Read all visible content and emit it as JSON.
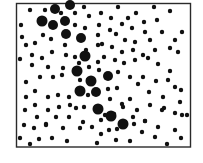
{
  "figure": {
    "background": "#ffffff",
    "frame": {
      "x": 16.5,
      "y": 3.5,
      "width": 174,
      "height": 143.5,
      "color": "#2a2a2a"
    },
    "dot_color": "#111111",
    "small_dots": [
      [
        30,
        10
      ],
      [
        45,
        10
      ],
      [
        70,
        7
      ],
      [
        84,
        7
      ],
      [
        118,
        7
      ],
      [
        154,
        7
      ],
      [
        170,
        11
      ],
      [
        21,
        25
      ],
      [
        61,
        13
      ],
      [
        75,
        13
      ],
      [
        89,
        16
      ],
      [
        101,
        13
      ],
      [
        111,
        18
      ],
      [
        128,
        18
      ],
      [
        136,
        13
      ],
      [
        144,
        22
      ],
      [
        157,
        20
      ],
      [
        22,
        37
      ],
      [
        43,
        35
      ],
      [
        51,
        39
      ],
      [
        75,
        25
      ],
      [
        85,
        28
      ],
      [
        99,
        25
      ],
      [
        110,
        30
      ],
      [
        122,
        24
      ],
      [
        132,
        28
      ],
      [
        145,
        32
      ],
      [
        162,
        32
      ],
      [
        182,
        32
      ],
      [
        26,
        45
      ],
      [
        35,
        43
      ],
      [
        65,
        45
      ],
      [
        98,
        35
      ],
      [
        102,
        44
      ],
      [
        116,
        34
      ],
      [
        125,
        40
      ],
      [
        135,
        42
      ],
      [
        150,
        40
      ],
      [
        175,
        40
      ],
      [
        20,
        59
      ],
      [
        32,
        55
      ],
      [
        42,
        58
      ],
      [
        52,
        52
      ],
      [
        66,
        55
      ],
      [
        75,
        57
      ],
      [
        86,
        50
      ],
      [
        98,
        45
      ],
      [
        112,
        47
      ],
      [
        122,
        52
      ],
      [
        133,
        50
      ],
      [
        143,
        55
      ],
      [
        155,
        50
      ],
      [
        170,
        48
      ],
      [
        178,
        52
      ],
      [
        32,
        65
      ],
      [
        48,
        67
      ],
      [
        63,
        68
      ],
      [
        79,
        63
      ],
      [
        89,
        67
      ],
      [
        98,
        62
      ],
      [
        104,
        57
      ],
      [
        115,
        60
      ],
      [
        124,
        63
      ],
      [
        135,
        60
      ],
      [
        148,
        58
      ],
      [
        158,
        64
      ],
      [
        170,
        71
      ],
      [
        26,
        82
      ],
      [
        40,
        77
      ],
      [
        53,
        77
      ],
      [
        62,
        75
      ],
      [
        80,
        80
      ],
      [
        88,
        80
      ],
      [
        99,
        70
      ],
      [
        108,
        75
      ],
      [
        118,
        72
      ],
      [
        130,
        77
      ],
      [
        143,
        77
      ],
      [
        156,
        81
      ],
      [
        168,
        80
      ],
      [
        26,
        97
      ],
      [
        35,
        91
      ],
      [
        48,
        97
      ],
      [
        58,
        95
      ],
      [
        69,
        97
      ],
      [
        88,
        95
      ],
      [
        108,
        89
      ],
      [
        117,
        88
      ],
      [
        130,
        99
      ],
      [
        138,
        84
      ],
      [
        149,
        92
      ],
      [
        163,
        97
      ],
      [
        175,
        87
      ],
      [
        181,
        90
      ],
      [
        25,
        110
      ],
      [
        35,
        105
      ],
      [
        48,
        110
      ],
      [
        59,
        107
      ],
      [
        70,
        105
      ],
      [
        76,
        108
      ],
      [
        84,
        107
      ],
      [
        105,
        115
      ],
      [
        110,
        99
      ],
      [
        122,
        104
      ],
      [
        137,
        110
      ],
      [
        150,
        105
      ],
      [
        164,
        108
      ],
      [
        180,
        102
      ],
      [
        24,
        125
      ],
      [
        37,
        117
      ],
      [
        46,
        124
      ],
      [
        56,
        117
      ],
      [
        69,
        117
      ],
      [
        83,
        122
      ],
      [
        101,
        120
      ],
      [
        114,
        114
      ],
      [
        123,
        107
      ],
      [
        133,
        117
      ],
      [
        145,
        121
      ],
      [
        162,
        110
      ],
      [
        175,
        113
      ],
      [
        187,
        115
      ],
      [
        20,
        138
      ],
      [
        34,
        128
      ],
      [
        46,
        125
      ],
      [
        63,
        128
      ],
      [
        80,
        128
      ],
      [
        92,
        127
      ],
      [
        101,
        134
      ],
      [
        109,
        130
      ],
      [
        117,
        129
      ],
      [
        134,
        124
      ],
      [
        145,
        121
      ],
      [
        158,
        127
      ],
      [
        175,
        130
      ],
      [
        182,
        115
      ],
      [
        30,
        144
      ],
      [
        39,
        139
      ],
      [
        52,
        138
      ],
      [
        67,
        141
      ],
      [
        97,
        143
      ],
      [
        116,
        140
      ],
      [
        130,
        141
      ],
      [
        142,
        132
      ],
      [
        155,
        137
      ],
      [
        167,
        144
      ],
      [
        181,
        138
      ]
    ],
    "large_dots": [
      [
        55,
        9,
        5
      ],
      [
        70,
        5,
        5
      ],
      [
        42,
        21,
        5.5
      ],
      [
        53,
        25,
        5
      ],
      [
        65,
        21,
        5
      ],
      [
        66,
        34,
        5
      ],
      [
        81,
        38,
        5
      ],
      [
        85,
        56,
        5.5
      ],
      [
        77,
        71,
        5.5
      ],
      [
        108,
        76,
        5
      ],
      [
        91,
        81,
        5.5
      ],
      [
        80,
        91,
        5.5
      ],
      [
        96,
        92,
        5
      ],
      [
        98,
        109,
        5.5
      ],
      [
        111,
        116,
        5.5
      ],
      [
        123,
        124,
        5.5
      ]
    ]
  }
}
